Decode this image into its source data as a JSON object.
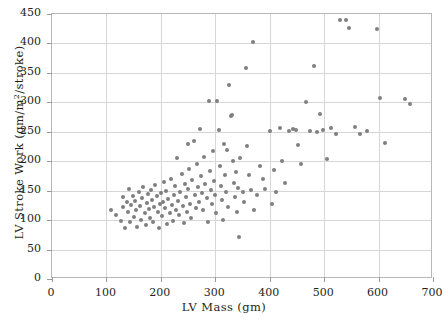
{
  "chart_data": {
    "type": "scatter",
    "title": "",
    "xlabel": "LV Mass (gm)",
    "ylabel": "LV Stroke Work (gm/m2/stroke)",
    "ylabel_parts": {
      "pre": "LV Stroke Work (gm/m",
      "sup": "2",
      "post": "/stroke)"
    },
    "xlim": [
      0,
      700
    ],
    "ylim": [
      0,
      450
    ],
    "xticks": [
      0,
      100,
      200,
      300,
      400,
      500,
      600,
      700
    ],
    "yticks": [
      0,
      50,
      100,
      150,
      200,
      250,
      300,
      350,
      400,
      450
    ],
    "xtick_labels": [
      "0",
      "100",
      "200",
      "300",
      "400",
      "500",
      "600",
      "700"
    ],
    "ytick_labels": [
      "0",
      "50",
      "100",
      "150",
      "200",
      "250",
      "300",
      "350",
      "400",
      "450"
    ],
    "grid": true,
    "grid_color": "#d6d6d6",
    "legend": null,
    "marker": {
      "shape": "circle",
      "color": "#7f7f7f",
      "size_px": 4
    },
    "n_points": 151,
    "points": [
      [
        108,
        117
      ],
      [
        118,
        108
      ],
      [
        126,
        99
      ],
      [
        130,
        140
      ],
      [
        131,
        122
      ],
      [
        135,
        86
      ],
      [
        138,
        131
      ],
      [
        140,
        113
      ],
      [
        142,
        152
      ],
      [
        144,
        96
      ],
      [
        146,
        126
      ],
      [
        148,
        141
      ],
      [
        150,
        106
      ],
      [
        152,
        133
      ],
      [
        155,
        118
      ],
      [
        157,
        88
      ],
      [
        160,
        147
      ],
      [
        162,
        124
      ],
      [
        164,
        101
      ],
      [
        166,
        137
      ],
      [
        168,
        156
      ],
      [
        170,
        112
      ],
      [
        172,
        92
      ],
      [
        174,
        129
      ],
      [
        176,
        144
      ],
      [
        178,
        119
      ],
      [
        180,
        104
      ],
      [
        182,
        151
      ],
      [
        184,
        134
      ],
      [
        186,
        97
      ],
      [
        188,
        122
      ],
      [
        190,
        159
      ],
      [
        192,
        141
      ],
      [
        194,
        113
      ],
      [
        196,
        86
      ],
      [
        198,
        128
      ],
      [
        200,
        146
      ],
      [
        202,
        107
      ],
      [
        204,
        131
      ],
      [
        206,
        165
      ],
      [
        208,
        120
      ],
      [
        210,
        150
      ],
      [
        212,
        94
      ],
      [
        214,
        136
      ],
      [
        216,
        112
      ],
      [
        218,
        170
      ],
      [
        220,
        126
      ],
      [
        222,
        99
      ],
      [
        224,
        143
      ],
      [
        226,
        158
      ],
      [
        228,
        118
      ],
      [
        230,
        205
      ],
      [
        232,
        133
      ],
      [
        234,
        108
      ],
      [
        236,
        148
      ],
      [
        238,
        178
      ],
      [
        240,
        124
      ],
      [
        242,
        95
      ],
      [
        244,
        162
      ],
      [
        246,
        139
      ],
      [
        248,
        113
      ],
      [
        250,
        229
      ],
      [
        250,
        152
      ],
      [
        252,
        186
      ],
      [
        254,
        128
      ],
      [
        256,
        104
      ],
      [
        258,
        168
      ],
      [
        260,
        235
      ],
      [
        262,
        143
      ],
      [
        264,
        121
      ],
      [
        266,
        196
      ],
      [
        268,
        156
      ],
      [
        270,
        131
      ],
      [
        272,
        255
      ],
      [
        274,
        175
      ],
      [
        276,
        146
      ],
      [
        278,
        118
      ],
      [
        280,
        208
      ],
      [
        282,
        161
      ],
      [
        284,
        137
      ],
      [
        286,
        97
      ],
      [
        288,
        303
      ],
      [
        290,
        183
      ],
      [
        292,
        151
      ],
      [
        294,
        128
      ],
      [
        296,
        218
      ],
      [
        298,
        167
      ],
      [
        300,
        142
      ],
      [
        302,
        112
      ],
      [
        304,
        303
      ],
      [
        306,
        253
      ],
      [
        308,
        192
      ],
      [
        310,
        158
      ],
      [
        312,
        134
      ],
      [
        314,
        101
      ],
      [
        316,
        229
      ],
      [
        318,
        176
      ],
      [
        320,
        148
      ],
      [
        322,
        219
      ],
      [
        324,
        122
      ],
      [
        326,
        329
      ],
      [
        328,
        277
      ],
      [
        330,
        279
      ],
      [
        332,
        201
      ],
      [
        334,
        163
      ],
      [
        336,
        139
      ],
      [
        338,
        181
      ],
      [
        340,
        113
      ],
      [
        342,
        155
      ],
      [
        344,
        71
      ],
      [
        346,
        206
      ],
      [
        350,
        148
      ],
      [
        352,
        131
      ],
      [
        356,
        359
      ],
      [
        358,
        226
      ],
      [
        362,
        177
      ],
      [
        366,
        151
      ],
      [
        370,
        403
      ],
      [
        372,
        118
      ],
      [
        376,
        143
      ],
      [
        382,
        192
      ],
      [
        388,
        169
      ],
      [
        392,
        153
      ],
      [
        400,
        252
      ],
      [
        404,
        128
      ],
      [
        408,
        185
      ],
      [
        412,
        147
      ],
      [
        418,
        256
      ],
      [
        422,
        201
      ],
      [
        428,
        163
      ],
      [
        436,
        252
      ],
      [
        442,
        255
      ],
      [
        448,
        253
      ],
      [
        452,
        227
      ],
      [
        458,
        196
      ],
      [
        466,
        301
      ],
      [
        474,
        252
      ],
      [
        482,
        362
      ],
      [
        486,
        250
      ],
      [
        492,
        281
      ],
      [
        498,
        253
      ],
      [
        505,
        203
      ],
      [
        512,
        256
      ],
      [
        522,
        247
      ],
      [
        530,
        440
      ],
      [
        540,
        440
      ],
      [
        546,
        427
      ],
      [
        556,
        258
      ],
      [
        566,
        246
      ],
      [
        578,
        252
      ],
      [
        598,
        425
      ],
      [
        602,
        308
      ],
      [
        612,
        231
      ],
      [
        648,
        305
      ],
      [
        658,
        298
      ]
    ]
  }
}
